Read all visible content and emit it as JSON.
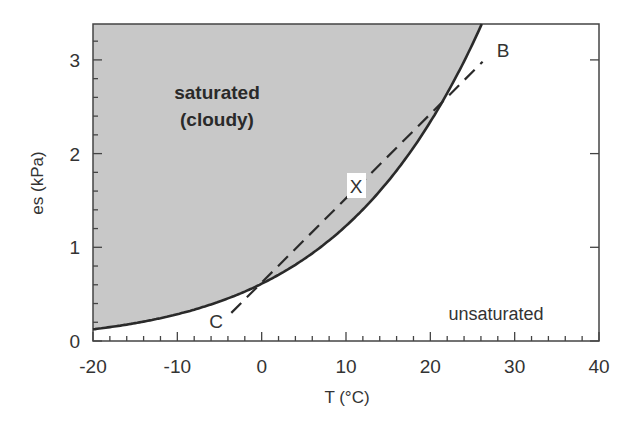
{
  "chart_data": {
    "type": "line",
    "title": "",
    "xlabel": "T (°C)",
    "ylabel": "es (kPa)",
    "xlim": [
      -20,
      40
    ],
    "ylim": [
      0,
      3.38
    ],
    "x_ticks": [
      "-20",
      "-10",
      "0",
      "10",
      "20",
      "30",
      "40"
    ],
    "y_ticks": [
      "0",
      "1",
      "2",
      "3"
    ],
    "grid": false,
    "legend": null,
    "series": [
      {
        "name": "saturation vapor pressure curve",
        "style": "solid",
        "x": [
          -20,
          -15,
          -10,
          -5,
          0,
          5,
          10,
          15,
          20,
          22,
          24,
          26
        ],
        "y": [
          0.13,
          0.19,
          0.29,
          0.42,
          0.61,
          0.87,
          1.23,
          1.71,
          2.34,
          2.64,
          2.98,
          3.36
        ]
      },
      {
        "name": "C-B dashed line",
        "style": "dashed",
        "x": [
          -3.6,
          26.2
        ],
        "y": [
          0.3,
          2.98
        ]
      }
    ],
    "annotations": [
      {
        "text": "saturated",
        "x": -5,
        "y": 2.6,
        "bold": true
      },
      {
        "text": "(cloudy)",
        "x": -5,
        "y": 2.3,
        "bold": true
      },
      {
        "text": "unsaturated",
        "x": 32,
        "y": 0.3
      },
      {
        "text": "B",
        "x": 28.5,
        "y": 3.1
      },
      {
        "text": "C",
        "x": -5.5,
        "y": 0.2
      },
      {
        "text": "X",
        "x": 11.4,
        "y": 1.6,
        "boxed": true
      }
    ],
    "shaded_region": {
      "name": "saturated",
      "color": "#c8c8c8",
      "area": "above curve"
    }
  },
  "caption": "Figure 7.7",
  "colors": {
    "shade": "#c8c8c8",
    "line": "#2a2a2a",
    "axis": "#444444"
  }
}
